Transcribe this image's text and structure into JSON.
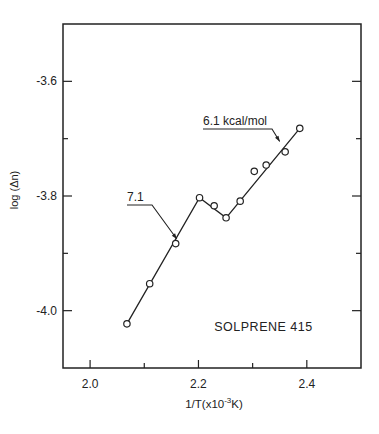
{
  "chart_data": {
    "type": "scatter",
    "title": "",
    "xlabel": "1/T(x10⁻³K)",
    "xlabel_parts": {
      "base": "1/T(x10",
      "sup": "-3",
      "tail": "K)"
    },
    "ylabel": "log (Δn)",
    "xlim": [
      1.95,
      2.5
    ],
    "ylim": [
      -4.1,
      -3.5
    ],
    "grid": false,
    "legend": null,
    "x_ticks": {
      "major": [
        2.0,
        2.2,
        2.4
      ],
      "minor": [
        2.1,
        2.3
      ],
      "labels": [
        "2.0",
        "2.2",
        "2.4"
      ]
    },
    "y_ticks": {
      "major": [
        -3.6,
        -3.8,
        -4.0
      ],
      "minor": [
        -3.7,
        -3.9
      ],
      "labels": [
        "-3.6",
        "-3.8",
        "-4.0"
      ]
    },
    "series": [
      {
        "name": "Solprene 415 data",
        "marker": "open-circle",
        "x": [
          2.068,
          2.11,
          2.158,
          2.202,
          2.229,
          2.251,
          2.277,
          2.303,
          2.325,
          2.36,
          2.387
        ],
        "y": [
          -4.023,
          -3.953,
          -3.883,
          -3.803,
          -3.817,
          -3.838,
          -3.809,
          -3.757,
          -3.746,
          -3.723,
          -3.682
        ]
      }
    ],
    "fit_line": {
      "name": "piecewise fit",
      "x": [
        2.068,
        2.202,
        2.251,
        2.387
      ],
      "y": [
        -4.023,
        -3.803,
        -3.838,
        -3.682
      ]
    },
    "annotations": [
      {
        "text": "7.1",
        "x_label_px": 127,
        "y_label_px": 201,
        "arrow_to": [
          2.16,
          -3.875
        ]
      },
      {
        "text": "6.1 kcal/mol",
        "x_label_px": 203,
        "y_label_px": 125,
        "arrow_to": [
          2.35,
          -3.705
        ]
      },
      {
        "text": "SOLPRENE 415",
        "x": 2.32,
        "y": -4.03
      }
    ]
  },
  "page": {
    "plot_px": {
      "left": 63,
      "top": 24,
      "right": 361,
      "bottom": 368
    },
    "colors": {
      "ink": "#222222",
      "background": "#ffffff"
    }
  }
}
